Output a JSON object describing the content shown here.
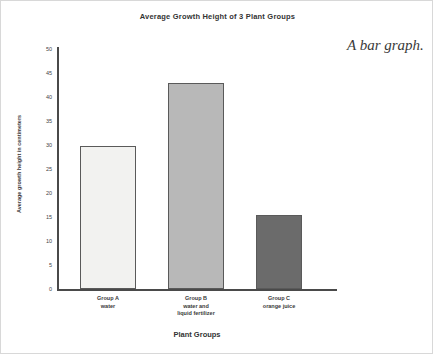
{
  "annotation": "A bar graph.",
  "chart_data": {
    "type": "bar",
    "title": "Average Growth Height of 3 Plant Groups",
    "xlabel": "Plant Groups",
    "ylabel": "Average growth height in centimeters",
    "categories": [
      "Group A",
      "Group B",
      "Group C"
    ],
    "category_sublabels": [
      [
        "water"
      ],
      [
        "water and",
        "liquid fertilizer"
      ],
      [
        "orange juice"
      ]
    ],
    "values": [
      29.7,
      43,
      15.5
    ],
    "ylim": [
      0,
      50
    ],
    "ytick_step": 5,
    "yticks": [
      0,
      5,
      10,
      15,
      20,
      25,
      30,
      35,
      40,
      45,
      50
    ],
    "grid": false,
    "legend": false,
    "bar_colors": [
      "#f2f2f0",
      "#b8b8b8",
      "#6b6b6b"
    ],
    "bar_edge_color": "#5a5a5a",
    "axis_color": "#4a4a4a"
  }
}
